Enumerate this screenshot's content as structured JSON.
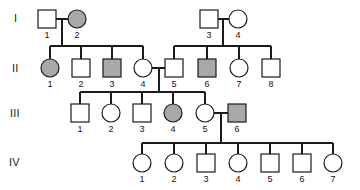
{
  "figure": {
    "type": "pedigree-chart",
    "background_color": "#ffffff",
    "line_color": "#1a1a1a",
    "affected_fill": "#a8a8a8",
    "unaffected_fill": "#ffffff",
    "generation_labels": [
      "I",
      "II",
      "III",
      "IV"
    ]
  },
  "chart_data": {
    "type": "diagram",
    "title": "",
    "legend": [],
    "generations": [
      {
        "label": "I",
        "label_x": 14,
        "label_y": 22,
        "row_y": 19,
        "individuals": [
          {
            "id": "1",
            "shape": "square",
            "affected": false,
            "x": 47,
            "y": 19,
            "label": "1",
            "label_x": 47,
            "label_y": 38
          },
          {
            "id": "2",
            "shape": "circle",
            "affected": true,
            "x": 77,
            "y": 19,
            "label": "2",
            "label_x": 77,
            "label_y": 38
          },
          {
            "id": "3",
            "shape": "square",
            "affected": false,
            "x": 209,
            "y": 19,
            "label": "3",
            "label_x": 209,
            "label_y": 38
          },
          {
            "id": "4",
            "shape": "circle",
            "affected": false,
            "x": 238,
            "y": 19,
            "label": "4",
            "label_x": 238,
            "label_y": 38
          }
        ]
      },
      {
        "label": "II",
        "label_x": 12,
        "label_y": 72,
        "row_y": 68,
        "individuals": [
          {
            "id": "1",
            "shape": "circle",
            "affected": true,
            "x": 50,
            "y": 68,
            "label": "1",
            "label_x": 50,
            "label_y": 87
          },
          {
            "id": "2",
            "shape": "square",
            "affected": false,
            "x": 81,
            "y": 68,
            "label": "2",
            "label_x": 81,
            "label_y": 87
          },
          {
            "id": "3",
            "shape": "square",
            "affected": true,
            "x": 112,
            "y": 68,
            "label": "3",
            "label_x": 112,
            "label_y": 87
          },
          {
            "id": "4",
            "shape": "circle",
            "affected": false,
            "x": 143,
            "y": 68,
            "label": "4",
            "label_x": 143,
            "label_y": 87
          },
          {
            "id": "5",
            "shape": "square",
            "affected": false,
            "x": 174,
            "y": 68,
            "label": "5",
            "label_x": 174,
            "label_y": 87
          },
          {
            "id": "6",
            "shape": "square",
            "affected": true,
            "x": 207,
            "y": 68,
            "label": "6",
            "label_x": 207,
            "label_y": 87
          },
          {
            "id": "7",
            "shape": "circle",
            "affected": false,
            "x": 239,
            "y": 68,
            "label": "7",
            "label_x": 239,
            "label_y": 87
          },
          {
            "id": "8",
            "shape": "square",
            "affected": false,
            "x": 271,
            "y": 68,
            "label": "8",
            "label_x": 271,
            "label_y": 87
          }
        ]
      },
      {
        "label": "III",
        "label_x": 10,
        "label_y": 117,
        "row_y": 113,
        "individuals": [
          {
            "id": "1",
            "shape": "square",
            "affected": false,
            "x": 80,
            "y": 113,
            "label": "1",
            "label_x": 80,
            "label_y": 132
          },
          {
            "id": "2",
            "shape": "circle",
            "affected": false,
            "x": 111,
            "y": 113,
            "label": "2",
            "label_x": 111,
            "label_y": 132
          },
          {
            "id": "3",
            "shape": "square",
            "affected": false,
            "x": 142,
            "y": 113,
            "label": "3",
            "label_x": 142,
            "label_y": 132
          },
          {
            "id": "4",
            "shape": "circle",
            "affected": true,
            "x": 173,
            "y": 113,
            "label": "4",
            "label_x": 173,
            "label_y": 132
          },
          {
            "id": "5",
            "shape": "circle",
            "affected": false,
            "x": 205,
            "y": 113,
            "label": "5",
            "label_x": 205,
            "label_y": 132
          },
          {
            "id": "6",
            "shape": "square",
            "affected": true,
            "x": 237,
            "y": 113,
            "label": "6",
            "label_x": 237,
            "label_y": 132
          }
        ]
      },
      {
        "label": "IV",
        "label_x": 9,
        "label_y": 166,
        "row_y": 163,
        "individuals": [
          {
            "id": "1",
            "shape": "circle",
            "affected": false,
            "x": 142,
            "y": 163,
            "label": "1",
            "label_x": 142,
            "label_y": 182
          },
          {
            "id": "2",
            "shape": "circle",
            "affected": false,
            "x": 174,
            "y": 163,
            "label": "2",
            "label_x": 174,
            "label_y": 182
          },
          {
            "id": "3",
            "shape": "square",
            "affected": false,
            "x": 206,
            "y": 163,
            "label": "3",
            "label_x": 206,
            "label_y": 182
          },
          {
            "id": "4",
            "shape": "circle",
            "affected": false,
            "x": 238,
            "y": 163,
            "label": "4",
            "label_x": 238,
            "label_y": 182
          },
          {
            "id": "5",
            "shape": "square",
            "affected": false,
            "x": 270,
            "y": 163,
            "label": "5",
            "label_x": 270,
            "label_y": 182
          },
          {
            "id": "6",
            "shape": "square",
            "affected": false,
            "x": 302,
            "y": 163,
            "label": "6",
            "label_x": 302,
            "label_y": 182
          },
          {
            "id": "7",
            "shape": "circle",
            "affected": false,
            "x": 333,
            "y": 163,
            "label": "7",
            "label_x": 333,
            "label_y": 182
          }
        ]
      }
    ],
    "symbol_size": 18,
    "connections": [
      {
        "name": "mating-I1-I2",
        "type": "line",
        "x1": 56,
        "y1": 19,
        "x2": 68,
        "y2": 19
      },
      {
        "name": "mating-I3-I4",
        "type": "line",
        "x1": 218,
        "y1": 19,
        "x2": 229,
        "y2": 19
      },
      {
        "name": "descent-I1I2",
        "type": "line",
        "x1": 62,
        "y1": 19,
        "x2": 62,
        "y2": 46
      },
      {
        "name": "sibship-II-left",
        "type": "line",
        "x1": 50,
        "y1": 46,
        "x2": 143,
        "y2": 46
      },
      {
        "name": "drop-II1",
        "type": "line",
        "x1": 50,
        "y1": 46,
        "x2": 50,
        "y2": 59
      },
      {
        "name": "drop-II2",
        "type": "line",
        "x1": 81,
        "y1": 46,
        "x2": 81,
        "y2": 59
      },
      {
        "name": "drop-II3",
        "type": "line",
        "x1": 112,
        "y1": 46,
        "x2": 112,
        "y2": 59
      },
      {
        "name": "drop-II4",
        "type": "line",
        "x1": 143,
        "y1": 46,
        "x2": 143,
        "y2": 59
      },
      {
        "name": "descent-I3I4",
        "type": "line",
        "x1": 223,
        "y1": 19,
        "x2": 223,
        "y2": 46
      },
      {
        "name": "sibship-II-right",
        "type": "line",
        "x1": 174,
        "y1": 46,
        "x2": 271,
        "y2": 46
      },
      {
        "name": "drop-II5",
        "type": "line",
        "x1": 174,
        "y1": 46,
        "x2": 174,
        "y2": 59
      },
      {
        "name": "drop-II6",
        "type": "line",
        "x1": 207,
        "y1": 46,
        "x2": 207,
        "y2": 59
      },
      {
        "name": "drop-II7",
        "type": "line",
        "x1": 239,
        "y1": 46,
        "x2": 239,
        "y2": 59
      },
      {
        "name": "drop-II8",
        "type": "line",
        "x1": 271,
        "y1": 46,
        "x2": 271,
        "y2": 59
      },
      {
        "name": "mating-II4-II5",
        "type": "line",
        "x1": 152,
        "y1": 68,
        "x2": 165,
        "y2": 68
      },
      {
        "name": "descent-II4II5",
        "type": "line",
        "x1": 159,
        "y1": 68,
        "x2": 159,
        "y2": 92
      },
      {
        "name": "sibship-III",
        "type": "line",
        "x1": 80,
        "y1": 92,
        "x2": 205,
        "y2": 92
      },
      {
        "name": "drop-III1",
        "type": "line",
        "x1": 80,
        "y1": 92,
        "x2": 80,
        "y2": 104
      },
      {
        "name": "drop-III2",
        "type": "line",
        "x1": 111,
        "y1": 92,
        "x2": 111,
        "y2": 104
      },
      {
        "name": "drop-III3",
        "type": "line",
        "x1": 142,
        "y1": 92,
        "x2": 142,
        "y2": 104
      },
      {
        "name": "drop-III4",
        "type": "line",
        "x1": 173,
        "y1": 92,
        "x2": 173,
        "y2": 104
      },
      {
        "name": "drop-III5",
        "type": "line",
        "x1": 205,
        "y1": 92,
        "x2": 205,
        "y2": 104
      },
      {
        "name": "mating-III5-III6",
        "type": "line",
        "x1": 214,
        "y1": 113,
        "x2": 228,
        "y2": 113
      },
      {
        "name": "descent-III5III6",
        "type": "line",
        "x1": 221,
        "y1": 113,
        "x2": 221,
        "y2": 143
      },
      {
        "name": "sibship-IV",
        "type": "line",
        "x1": 142,
        "y1": 143,
        "x2": 333,
        "y2": 143
      },
      {
        "name": "drop-IV1",
        "type": "line",
        "x1": 142,
        "y1": 143,
        "x2": 142,
        "y2": 154
      },
      {
        "name": "drop-IV2",
        "type": "line",
        "x1": 174,
        "y1": 143,
        "x2": 174,
        "y2": 154
      },
      {
        "name": "drop-IV3",
        "type": "line",
        "x1": 206,
        "y1": 143,
        "x2": 206,
        "y2": 154
      },
      {
        "name": "drop-IV4",
        "type": "line",
        "x1": 238,
        "y1": 143,
        "x2": 238,
        "y2": 154
      },
      {
        "name": "drop-IV5",
        "type": "line",
        "x1": 270,
        "y1": 143,
        "x2": 270,
        "y2": 154
      },
      {
        "name": "drop-IV6",
        "type": "line",
        "x1": 302,
        "y1": 143,
        "x2": 302,
        "y2": 154
      },
      {
        "name": "drop-IV7",
        "type": "line",
        "x1": 333,
        "y1": 143,
        "x2": 333,
        "y2": 154
      }
    ]
  }
}
